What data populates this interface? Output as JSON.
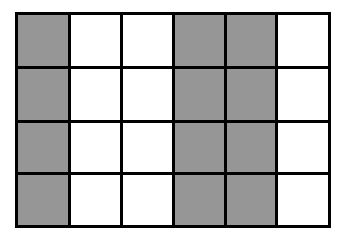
{
  "figure": {
    "kind": "shaded-grid",
    "columns": 6,
    "rows": 4,
    "total_cells": 24,
    "shaded_cells": 12,
    "unshaded_cells": 12,
    "shaded_fraction": "1/2",
    "colors": {
      "shaded": "#969696",
      "unshaded": "#ffffff",
      "line": "#000000",
      "background": "#ffffff"
    },
    "line_width_px": 3,
    "column_labels": [
      "1",
      "2",
      "3",
      "4",
      "5",
      "6"
    ],
    "row_labels": [
      "1",
      "2",
      "3",
      "4"
    ],
    "cells": [
      [
        {
          "id": "r1c1",
          "fill": "shaded"
        },
        {
          "id": "r1c2",
          "fill": "unshaded"
        },
        {
          "id": "r1c3",
          "fill": "unshaded"
        },
        {
          "id": "r1c4",
          "fill": "shaded"
        },
        {
          "id": "r1c5",
          "fill": "shaded"
        },
        {
          "id": "r1c6",
          "fill": "unshaded"
        }
      ],
      [
        {
          "id": "r2c1",
          "fill": "shaded"
        },
        {
          "id": "r2c2",
          "fill": "unshaded"
        },
        {
          "id": "r2c3",
          "fill": "unshaded"
        },
        {
          "id": "r2c4",
          "fill": "shaded"
        },
        {
          "id": "r2c5",
          "fill": "shaded"
        },
        {
          "id": "r2c6",
          "fill": "unshaded"
        }
      ],
      [
        {
          "id": "r3c1",
          "fill": "shaded"
        },
        {
          "id": "r3c2",
          "fill": "unshaded"
        },
        {
          "id": "r3c3",
          "fill": "unshaded"
        },
        {
          "id": "r3c4",
          "fill": "shaded"
        },
        {
          "id": "r3c5",
          "fill": "shaded"
        },
        {
          "id": "r3c6",
          "fill": "unshaded"
        }
      ],
      [
        {
          "id": "r4c1",
          "fill": "shaded"
        },
        {
          "id": "r4c2",
          "fill": "unshaded"
        },
        {
          "id": "r4c3",
          "fill": "unshaded"
        },
        {
          "id": "r4c4",
          "fill": "shaded"
        },
        {
          "id": "r4c5",
          "fill": "shaded"
        },
        {
          "id": "r4c6",
          "fill": "unshaded"
        }
      ]
    ]
  }
}
